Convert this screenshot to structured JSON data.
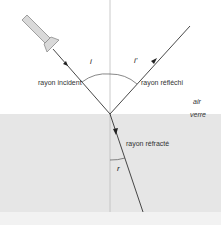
{
  "diagram": {
    "labels": {
      "incident_ray": "rayon incident",
      "reflected_ray": "rayon réfléchi",
      "refracted_ray": "rayon réfracté",
      "medium_top": "air",
      "medium_bottom": "verre",
      "angle_incidence": "i",
      "angle_reflection": "i'",
      "angle_refraction": "r"
    },
    "colors": {
      "background_air": "#ffffff",
      "background_glass": "#e6e6e6",
      "bottom_strip": "#f2f2f2",
      "ray": "#333333",
      "normal": "#bdbdbd",
      "source_fill": "#d9d9d9",
      "source_stroke": "#8c8c8c"
    }
  }
}
